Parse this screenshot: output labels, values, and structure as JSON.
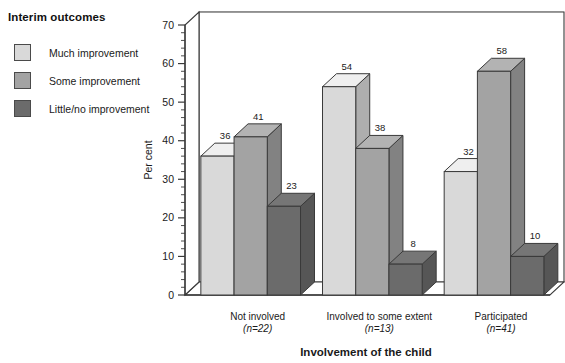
{
  "legend": {
    "title": "Interim outcomes",
    "items": [
      {
        "label": "Much improvement",
        "color": "#d9d9d9"
      },
      {
        "label": "Some improvement",
        "color": "#a3a3a3"
      },
      {
        "label": "Little/no improvement",
        "color": "#6b6b6b"
      }
    ]
  },
  "chart_data": {
    "type": "bar",
    "title": "",
    "xlabel": "Involvement of the child",
    "ylabel": "Per cent",
    "ylim": [
      0,
      70
    ],
    "yticks": [
      0,
      10,
      20,
      30,
      40,
      50,
      60,
      70
    ],
    "ytick_labels": [
      "0",
      "10",
      "20",
      "30",
      "40",
      "50",
      "60",
      "70"
    ],
    "minor_tick_step": 2,
    "grid": true,
    "legend_position": "top-left-outside",
    "three_d": true,
    "categories": [
      "Not involved",
      "Involved to some extent",
      "Participated"
    ],
    "category_sublabels": [
      "(n=22)",
      "(n=13)",
      "(n=41)"
    ],
    "series": [
      {
        "name": "Much improvement",
        "color": "#d9d9d9",
        "values": [
          36,
          54,
          32
        ]
      },
      {
        "name": "Some improvement",
        "color": "#a3a3a3",
        "values": [
          41,
          38,
          58
        ]
      },
      {
        "name": "Little/no improvement",
        "color": "#6b6b6b",
        "values": [
          23,
          8,
          10
        ]
      }
    ],
    "data_labels": [
      [
        "36",
        "41",
        "23"
      ],
      [
        "54",
        "38",
        "8"
      ],
      [
        "32",
        "58",
        "10"
      ]
    ]
  }
}
